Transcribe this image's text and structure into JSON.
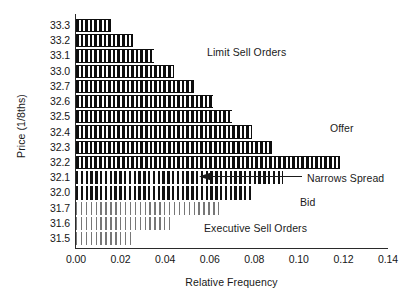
{
  "chart_data": {
    "type": "bar",
    "orientation": "horizontal",
    "title": "",
    "xlabel": "Relative Frequency",
    "ylabel": "Price (1/8ths)",
    "xlim": [
      0.0,
      0.14
    ],
    "xticks": [
      "0.00",
      "0.02",
      "0.04",
      "0.06",
      "0.08",
      "0.10",
      "0.12",
      "0.14"
    ],
    "xtick_values": [
      0.0,
      0.02,
      0.04,
      0.06,
      0.08,
      0.1,
      0.12,
      0.14
    ],
    "grid": false,
    "legend": "none",
    "categories": [
      "33.3",
      "33.2",
      "33.1",
      "33.0",
      "32.7",
      "32.6",
      "32.5",
      "32.4",
      "32.3",
      "32.2",
      "32.1",
      "32.0",
      "31.7",
      "31.6",
      "31.5"
    ],
    "series": [
      {
        "name": "Relative Frequency",
        "values": [
          0.0155,
          0.0255,
          0.035,
          0.044,
          0.053,
          0.0615,
          0.07,
          0.079,
          0.088,
          0.1185,
          0.093,
          0.08,
          0.064,
          0.042,
          0.025
        ],
        "styles": [
          "dark",
          "dark",
          "dark",
          "dark",
          "dark",
          "dark",
          "dark",
          "dark",
          "dark",
          "dark",
          "mid",
          "mid",
          "light",
          "light",
          "light"
        ]
      }
    ],
    "annotations": [
      {
        "id": "limit-sell",
        "text": "Limit Sell Orders"
      },
      {
        "id": "offer",
        "text": "Offer"
      },
      {
        "id": "narrows-spread",
        "text": "Narrows Spread"
      },
      {
        "id": "bid",
        "text": "Bid"
      },
      {
        "id": "executive-sell",
        "text": "Executive Sell Orders"
      }
    ],
    "colors": {
      "bar_dark": "#0d0d0d",
      "bar_mid": "#111111",
      "bar_light": "#5f5f5f",
      "axis": "#2a2a2a",
      "text": "#1a1a1a",
      "background": "#ffffff"
    }
  }
}
